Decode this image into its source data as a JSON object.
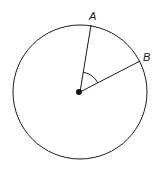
{
  "diagram": {
    "type": "circle-with-central-angle",
    "stroke_color": "#1a1a1a",
    "background": "#ffffff",
    "circle": {
      "cx": 80,
      "cy": 92,
      "r": 67
    },
    "center_point": {
      "x": 80,
      "y": 92
    },
    "points": [
      {
        "name": "A",
        "label": "A",
        "x": 91,
        "y": 25
      },
      {
        "name": "B",
        "label": "B",
        "x": 140,
        "y": 61
      }
    ],
    "radii": [
      "A",
      "B"
    ],
    "angle_marker": {
      "between": [
        "A",
        "B"
      ],
      "vertex": "center",
      "radius": 20
    }
  }
}
